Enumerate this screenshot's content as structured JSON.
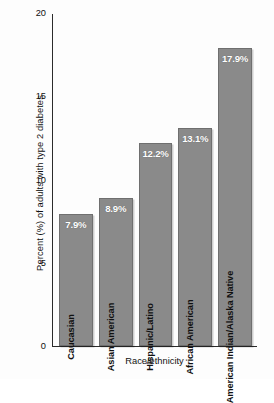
{
  "chart_data": {
    "type": "bar",
    "title": "",
    "xlabel": "Race/ethnicity",
    "ylabel": "Percent (%) of adults with type 2 diabetes",
    "categories": [
      "Caucasian",
      "Asian American",
      "Hispanic/Latino",
      "African American",
      "American Indian/Alaska Native"
    ],
    "values": [
      7.9,
      8.9,
      12.2,
      13.1,
      17.9
    ],
    "value_labels": [
      "7.9%",
      "8.9%",
      "12.2%",
      "13.1%",
      "17.9%"
    ],
    "ylim": [
      0,
      20
    ],
    "yticks": [
      0,
      5,
      10,
      15,
      20
    ],
    "ytick_labels": [
      "0",
      "5",
      "10",
      "15",
      "20"
    ],
    "grid": false,
    "legend": "none",
    "bar_color": "#8a8a8a",
    "bar_edge_color": "#6f6f6f",
    "axis_color": "#2b2b2b",
    "label_color": "#111111",
    "value_label_color": "#ffffff",
    "background": "#fdfdfd"
  }
}
